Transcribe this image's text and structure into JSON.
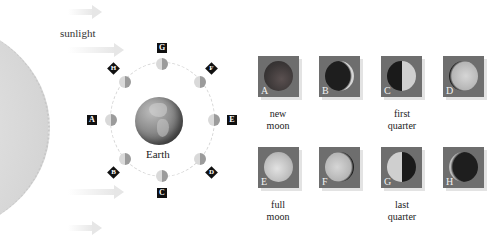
{
  "diagram": {
    "sunlight_label": "sunlight",
    "earth_label": "Earth",
    "orbit_positions": [
      {
        "label": "A",
        "position": "left"
      },
      {
        "label": "B",
        "position": "lower-left"
      },
      {
        "label": "C",
        "position": "bottom"
      },
      {
        "label": "D",
        "position": "lower-right"
      },
      {
        "label": "E",
        "position": "right"
      },
      {
        "label": "F",
        "position": "upper-right"
      },
      {
        "label": "G",
        "position": "top"
      },
      {
        "label": "H",
        "position": "upper-left"
      }
    ],
    "phase_tiles": [
      {
        "letter": "A",
        "phase": "new moon"
      },
      {
        "letter": "B",
        "phase": "waxing crescent"
      },
      {
        "letter": "C",
        "phase": "first quarter"
      },
      {
        "letter": "D",
        "phase": "waxing gibbous"
      },
      {
        "letter": "E",
        "phase": "full moon"
      },
      {
        "letter": "F",
        "phase": "waning gibbous"
      },
      {
        "letter": "G",
        "phase": "last quarter"
      },
      {
        "letter": "H",
        "phase": "waning crescent"
      }
    ],
    "captions": {
      "new_moon_1": "new",
      "new_moon_2": "moon",
      "first_quarter_1": "first",
      "first_quarter_2": "quarter",
      "full_moon_1": "full",
      "full_moon_2": "moon",
      "last_quarter_1": "last",
      "last_quarter_2": "quarter"
    },
    "colors": {
      "tile_bg": "#6e6e6e",
      "tag_bg": "#111111",
      "sun": "#dcdcdc"
    }
  }
}
